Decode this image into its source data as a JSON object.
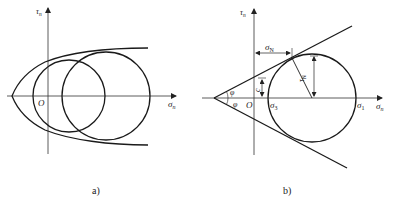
{
  "panels": [
    {
      "id": "a",
      "caption": "a)",
      "x_axis_label": "σ",
      "x_axis_sub": "n",
      "y_axis_label": "τ",
      "y_axis_sub": "n",
      "origin_label": "O",
      "elements": [
        "parabolic strength envelope",
        "Mohr circle (small)",
        "Mohr circle (large)"
      ]
    },
    {
      "id": "b",
      "caption": "b)",
      "x_axis_label": "σ",
      "x_axis_sub": "n",
      "y_axis_label": "τ",
      "y_axis_sub": "n",
      "origin_label": "O",
      "sigma3_label": "σ",
      "sigma3_sub": "3",
      "sigma1_label": "σ",
      "sigma1_sub": "1",
      "sigmaN_label": "σ",
      "sigmaN_sub": "N",
      "tauN_label": "τ",
      "tauN_sub": "N",
      "cohesion_label": "c",
      "phi_upper_label": "φ",
      "phi_lower_label": "φ",
      "elements": [
        "linear Mohr-Coulomb envelope",
        "Mohr circle",
        "tangent radius"
      ]
    }
  ],
  "colors": {
    "line": "#1a1a1a",
    "axis": "#333333",
    "background": "#ffffff"
  }
}
